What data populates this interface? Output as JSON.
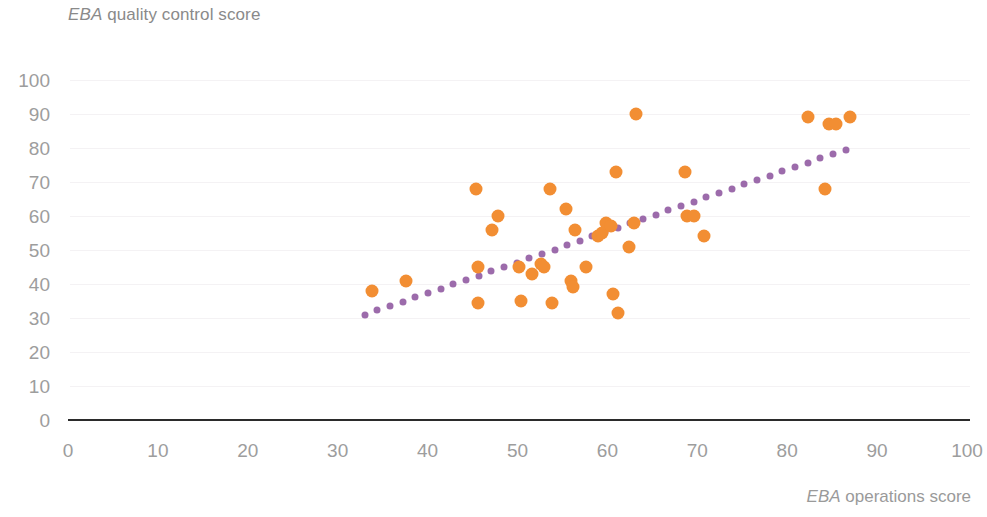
{
  "chart_data": {
    "type": "scatter",
    "title": "EBA quality control score",
    "title_emphasis": "EBA",
    "title_rest": " quality control score",
    "xlabel": "EBA operations score",
    "xlabel_emphasis": "EBA",
    "xlabel_rest": " operations score",
    "ylabel": "EBA quality control score",
    "xlim": [
      0,
      100
    ],
    "ylim": [
      0,
      100
    ],
    "xticks": [
      0,
      10,
      20,
      30,
      40,
      50,
      60,
      70,
      80,
      90,
      100
    ],
    "yticks": [
      0,
      10,
      20,
      30,
      40,
      50,
      60,
      70,
      80,
      90,
      100
    ],
    "grid": "faint-horizontal",
    "legend": "none",
    "point_color": "#f28e33",
    "trendline_color": "#9c6bab",
    "trendline_style": "dotted",
    "series": [
      {
        "name": "EBA countries",
        "color": "#f28e33",
        "points": [
          [
            33.8,
            38
          ],
          [
            37.6,
            41
          ],
          [
            45.4,
            68
          ],
          [
            45.6,
            45
          ],
          [
            45.6,
            34.5
          ],
          [
            47.2,
            56
          ],
          [
            47.8,
            60
          ],
          [
            50.2,
            45
          ],
          [
            50.4,
            35
          ],
          [
            51.6,
            43
          ],
          [
            52.6,
            46
          ],
          [
            53.0,
            45
          ],
          [
            53.6,
            68
          ],
          [
            53.8,
            34.5
          ],
          [
            55.4,
            62
          ],
          [
            56.0,
            41
          ],
          [
            56.2,
            39
          ],
          [
            56.4,
            56
          ],
          [
            57.6,
            45
          ],
          [
            59.0,
            54
          ],
          [
            59.4,
            55
          ],
          [
            59.8,
            58
          ],
          [
            60.4,
            57
          ],
          [
            60.6,
            37
          ],
          [
            61.0,
            73
          ],
          [
            61.2,
            31.5
          ],
          [
            62.4,
            51
          ],
          [
            63.0,
            58
          ],
          [
            63.2,
            90
          ],
          [
            68.6,
            73
          ],
          [
            68.8,
            60
          ],
          [
            69.6,
            60
          ],
          [
            70.8,
            54
          ],
          [
            82.3,
            89
          ],
          [
            84.2,
            68
          ],
          [
            84.6,
            87
          ],
          [
            85.4,
            87
          ],
          [
            87.0,
            89
          ]
        ]
      }
    ],
    "trendline": {
      "name": "linear fit",
      "x_start": 33.0,
      "y_start": 31.0,
      "x_end": 86.5,
      "y_end": 79.5
    }
  }
}
